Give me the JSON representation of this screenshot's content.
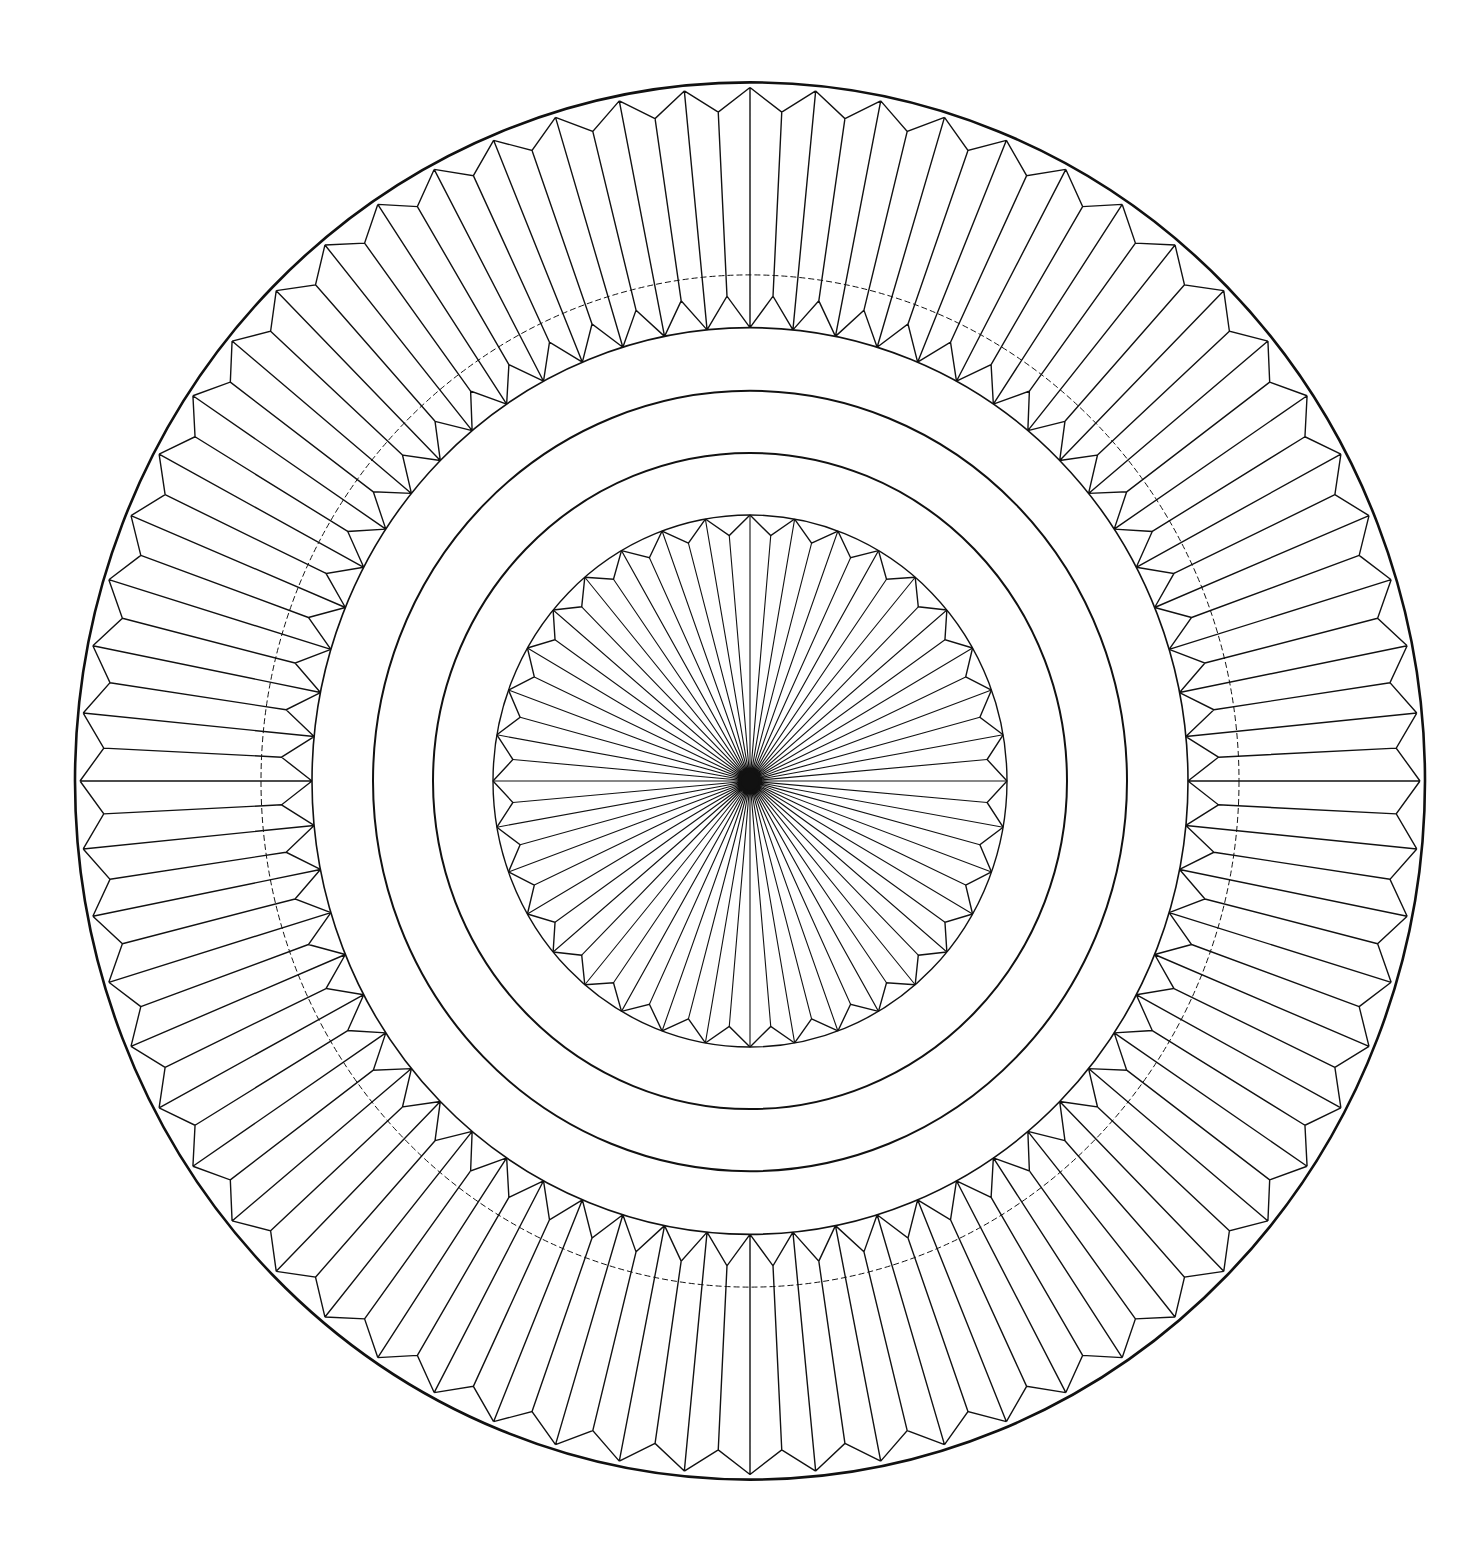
{
  "title": "Geometric mandala line drawing",
  "canvas": {
    "width": 1475,
    "height": 1550,
    "background": "#ffffff",
    "stroke": "#111111"
  },
  "mandala": {
    "center": [
      750,
      781
    ],
    "y_scale": 1.035,
    "outer_border": {
      "radius": 675,
      "stroke_width": 2.6
    },
    "outer_band": {
      "teeth": 64,
      "outer_point_radius": 670,
      "outer_valley_radius": 647,
      "inner_peak_radius": 469,
      "inner_point_radius": 438,
      "stroke_width": 1.4
    },
    "dashed_circle": {
      "radius": 489,
      "stroke_width": 1.0,
      "dash": "6 3"
    },
    "inner_band_circle": {
      "radius": 438,
      "stroke_width": 1.6
    },
    "plain_rings": [
      {
        "radius": 377,
        "stroke_width": 2.0
      },
      {
        "radius": 317,
        "stroke_width": 2.0
      }
    ],
    "medallion": {
      "teeth": 36,
      "radius": 257,
      "valley_radius": 238,
      "stroke_width": 1.4,
      "ray_stroke_width": 1.1
    }
  }
}
